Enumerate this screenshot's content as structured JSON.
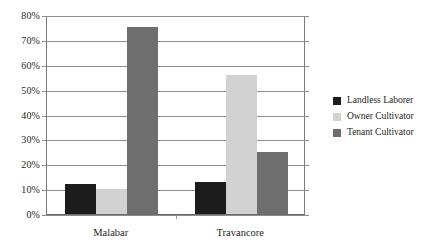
{
  "chart_data": {
    "type": "bar",
    "title": "",
    "xlabel": "",
    "ylabel": "",
    "categories": [
      "Malabar",
      "Travancore"
    ],
    "series": [
      {
        "name": "Landless Laborer",
        "color": "#1c1c1c",
        "values": [
          12,
          13
        ]
      },
      {
        "name": "Owner Cultivator",
        "color": "#d2d2d2",
        "values": [
          10,
          56
        ]
      },
      {
        "name": "Tenant Cultivator",
        "color": "#6e6e6e",
        "values": [
          75,
          25
        ]
      }
    ],
    "ylim": [
      0,
      80
    ],
    "ytick_values": [
      0,
      10,
      20,
      30,
      40,
      50,
      60,
      70,
      80
    ],
    "ytick_labels": [
      "0%",
      "10%",
      "20%",
      "30%",
      "40%",
      "50%",
      "60%",
      "70%",
      "80%"
    ],
    "grid": true,
    "legend_position": "right"
  },
  "legend": {
    "items": [
      {
        "label": "Landless Laborer",
        "color": "#1c1c1c"
      },
      {
        "label": "Owner Cultivator",
        "color": "#d2d2d2"
      },
      {
        "label": "Tenant Cultivator",
        "color": "#6e6e6e"
      }
    ]
  },
  "axis": {
    "y_labels": [
      "80%",
      "70%",
      "60%",
      "50%",
      "40%",
      "30%",
      "20%",
      "10%",
      "0%"
    ],
    "x_labels": [
      "Malabar",
      "Travancore"
    ]
  }
}
